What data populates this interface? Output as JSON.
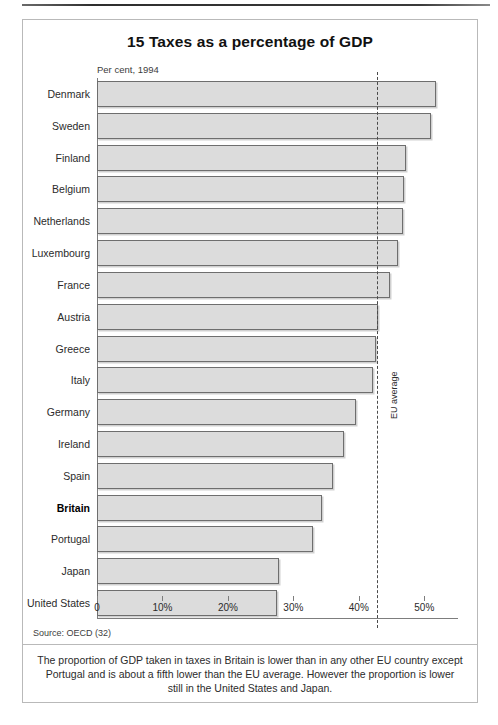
{
  "figure": {
    "title": "15 Taxes as a percentage of GDP",
    "subtitle": "Per cent, 1994",
    "source": "Source: OECD (32)",
    "caption": "The proportion of GDP taken in taxes in Britain is lower than in any other EU country except Portugal and is about a fifth lower than the EU average. However the proportion is lower still in the United States and Japan."
  },
  "chart_data": {
    "type": "bar",
    "orientation": "horizontal",
    "title": "15 Taxes as a percentage of GDP",
    "subtitle": "Per cent, 1994",
    "xlabel": "",
    "ylabel": "",
    "xlim": [
      0,
      55
    ],
    "grid": false,
    "legend": null,
    "tick_labels": [
      "0",
      "10%",
      "20%",
      "30%",
      "40%",
      "50%"
    ],
    "tick_values": [
      0,
      10,
      20,
      30,
      40,
      50
    ],
    "categories": [
      "Denmark",
      "Sweden",
      "Finland",
      "Belgium",
      "Netherlands",
      "Luxembourg",
      "France",
      "Austria",
      "Greece",
      "Italy",
      "Germany",
      "Ireland",
      "Spain",
      "Britain",
      "Portugal",
      "Japan",
      "United States"
    ],
    "values": [
      51.8,
      51.0,
      47.2,
      46.9,
      46.7,
      46.0,
      44.8,
      43.0,
      42.6,
      42.2,
      39.5,
      37.7,
      36.0,
      34.3,
      33.0,
      27.8,
      27.5
    ],
    "highlight": "Britain",
    "annotations": [
      {
        "name": "eu-average",
        "label": "EU average",
        "value": 42.8,
        "style": "vertical-dashed-line"
      }
    ]
  }
}
